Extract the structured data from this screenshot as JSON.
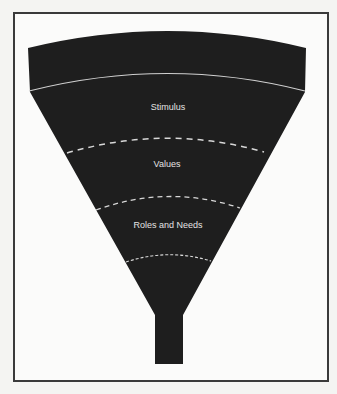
{
  "diagram": {
    "type": "funnel",
    "fill_color": "#1e1e1e",
    "divider_color": "#d8d8d8",
    "stages": [
      {
        "label": "Stimulus"
      },
      {
        "label": "Values"
      },
      {
        "label": "Roles and Needs"
      }
    ]
  }
}
